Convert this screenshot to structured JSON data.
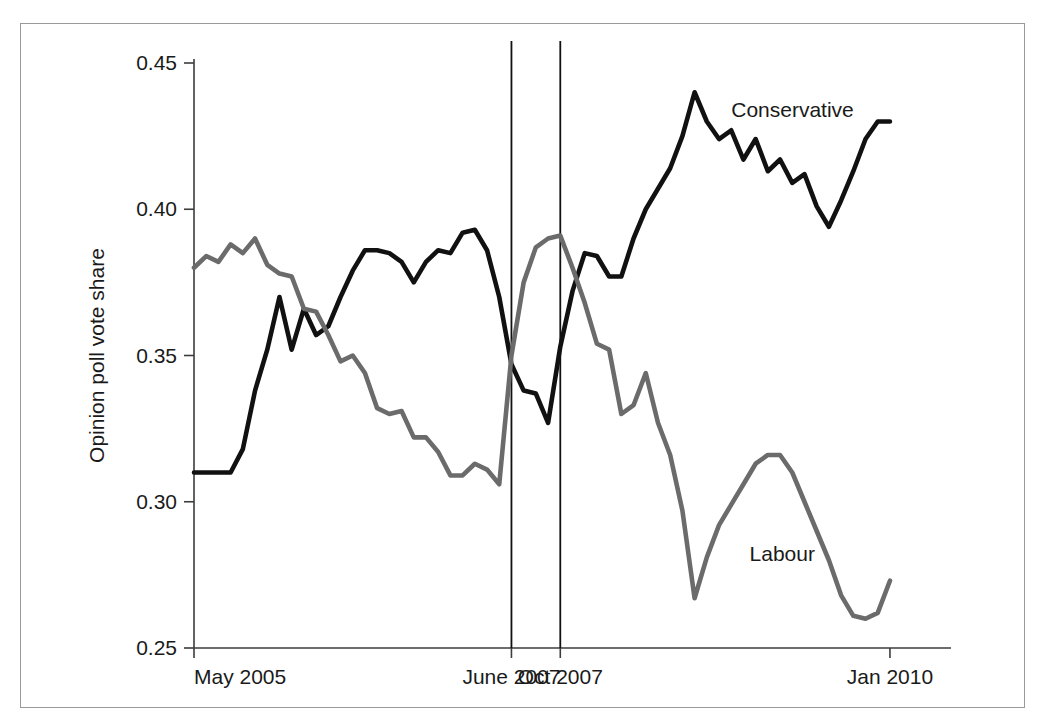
{
  "chart_data": {
    "type": "line",
    "title": "",
    "xlabel": "",
    "ylabel": "Opinion poll vote share",
    "ylim": [
      0.25,
      0.45
    ],
    "yticks": [
      0.25,
      0.3,
      0.35,
      0.4,
      0.45
    ],
    "ytick_labels": [
      "0.25",
      "0.30",
      "0.35",
      "0.40",
      "0.45"
    ],
    "xtick_labels": [
      "May 2005",
      "June 2007",
      "Oct 2007",
      "Jan 2010"
    ],
    "xtick_positions": [
      0,
      26,
      30,
      57
    ],
    "xlim": [
      0,
      62
    ],
    "grid": false,
    "legend_position": "inline-annotations",
    "annotations": [
      {
        "text": "Conservative",
        "x": 44,
        "y": 0.434
      },
      {
        "text": "Labour",
        "x": 45.5,
        "y": 0.282
      }
    ],
    "event_lines": [
      {
        "label": "June 2007",
        "x": 26
      },
      {
        "label": "Oct 2007",
        "x": 30
      }
    ],
    "series": [
      {
        "name": "Conservative",
        "color": "#111111",
        "width": 4.6,
        "x": [
          0,
          1,
          2,
          3,
          4,
          5,
          6,
          7,
          8,
          9,
          10,
          11,
          12,
          13,
          14,
          15,
          16,
          17,
          18,
          19,
          20,
          21,
          22,
          23,
          24,
          25,
          26,
          27,
          28,
          29,
          30,
          31,
          32,
          33,
          34,
          35,
          36,
          37,
          38,
          39,
          40,
          41,
          42,
          43,
          44,
          45,
          46,
          47,
          48,
          49,
          50,
          51,
          52,
          53,
          54,
          55,
          56,
          57
        ],
        "values": [
          0.31,
          0.31,
          0.31,
          0.31,
          0.318,
          0.338,
          0.352,
          0.37,
          0.352,
          0.366,
          0.357,
          0.36,
          0.37,
          0.379,
          0.386,
          0.386,
          0.385,
          0.382,
          0.375,
          0.382,
          0.386,
          0.385,
          0.392,
          0.393,
          0.386,
          0.37,
          0.347,
          0.338,
          0.337,
          0.327,
          0.353,
          0.372,
          0.385,
          0.384,
          0.377,
          0.377,
          0.39,
          0.4,
          0.407,
          0.414,
          0.425,
          0.44,
          0.43,
          0.424,
          0.427,
          0.417,
          0.424,
          0.413,
          0.417,
          0.409,
          0.412,
          0.401,
          0.394,
          0.403,
          0.413,
          0.424,
          0.43,
          0.43
        ]
      },
      {
        "name": "Labour",
        "color": "#6b6b6b",
        "width": 4.6,
        "x": [
          0,
          1,
          2,
          3,
          4,
          5,
          6,
          7,
          8,
          9,
          10,
          11,
          12,
          13,
          14,
          15,
          16,
          17,
          18,
          19,
          20,
          21,
          22,
          23,
          24,
          25,
          26,
          27,
          28,
          29,
          30,
          31,
          32,
          33,
          34,
          35,
          36,
          37,
          38,
          39,
          40,
          41,
          42,
          43,
          44,
          45,
          46,
          47,
          48,
          49,
          50,
          51,
          52,
          53,
          54,
          55,
          56,
          57
        ],
        "values": [
          0.38,
          0.384,
          0.382,
          0.388,
          0.385,
          0.39,
          0.381,
          0.378,
          0.377,
          0.366,
          0.365,
          0.357,
          0.348,
          0.35,
          0.344,
          0.332,
          0.33,
          0.331,
          0.322,
          0.322,
          0.317,
          0.309,
          0.309,
          0.313,
          0.311,
          0.306,
          0.35,
          0.375,
          0.387,
          0.39,
          0.391,
          0.38,
          0.368,
          0.354,
          0.352,
          0.33,
          0.333,
          0.344,
          0.327,
          0.316,
          0.297,
          0.267,
          0.281,
          0.292,
          0.299,
          0.306,
          0.313,
          0.316,
          0.316,
          0.31,
          0.3,
          0.29,
          0.28,
          0.268,
          0.261,
          0.26,
          0.262,
          0.273
        ]
      }
    ]
  },
  "figure": {
    "plot_left": 193,
    "plot_right": 950,
    "plot_top": 62,
    "plot_bottom": 647
  }
}
